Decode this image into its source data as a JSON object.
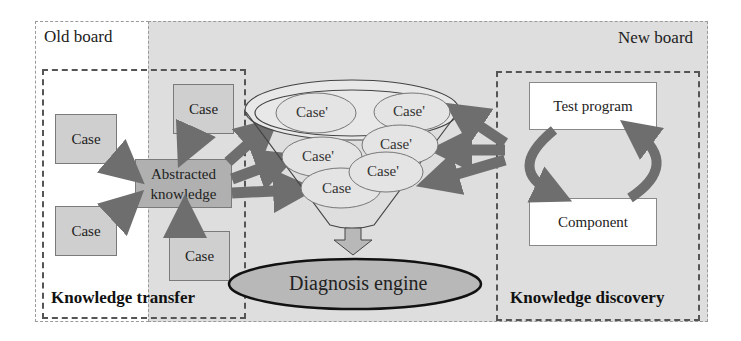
{
  "regions": {
    "old_board": {
      "label": "Old board"
    },
    "new_board": {
      "label": "New board"
    }
  },
  "knowledge_transfer": {
    "title": "Knowledge transfer",
    "cases": [
      "Case",
      "Case",
      "Case",
      "Case"
    ],
    "abstracted": {
      "line1": "Abstracted",
      "line2": "knowledge"
    }
  },
  "funnel": {
    "cases": [
      "Case'",
      "Case'",
      "Case'",
      "Case'",
      "Case'",
      "Case"
    ]
  },
  "diagnosis_engine": {
    "label": "Diagnosis engine"
  },
  "knowledge_discovery": {
    "title": "Knowledge discovery",
    "test_program": "Test program",
    "component": "Component"
  },
  "colors": {
    "arrow": "#6e6e6e",
    "new_board_bg": "#dedede",
    "case_fill": "#cfcfcf",
    "engine_fill": "#b8b8b8"
  }
}
